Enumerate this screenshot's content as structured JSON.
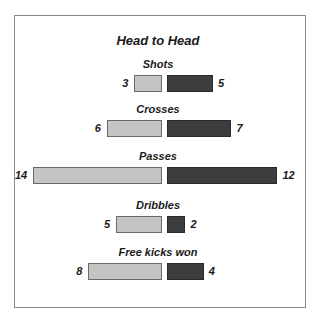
{
  "title": "Head to Head",
  "colors": {
    "left": "#c4c4c4",
    "right": "#3d3d3d"
  },
  "chart_data": {
    "type": "bar",
    "orientation": "horizontal-diverging",
    "title": "Head to Head",
    "categories": [
      "Shots",
      "Crosses",
      "Passes",
      "Dribbles",
      "Free kicks won"
    ],
    "series": [
      {
        "name": "Left team",
        "color": "#c4c4c4",
        "values": [
          3,
          6,
          14,
          5,
          8
        ]
      },
      {
        "name": "Right team",
        "color": "#3d3d3d",
        "values": [
          5,
          7,
          12,
          2,
          4
        ]
      }
    ],
    "grid": false,
    "legend": "none"
  },
  "rows": [
    {
      "label": "Shots",
      "left": "3",
      "right": "5"
    },
    {
      "label": "Crosses",
      "left": "6",
      "right": "7"
    },
    {
      "label": "Passes",
      "left": "14",
      "right": "12"
    },
    {
      "label": "Dribbles",
      "left": "5",
      "right": "2"
    },
    {
      "label": "Free kicks won",
      "left": "8",
      "right": "4"
    }
  ]
}
